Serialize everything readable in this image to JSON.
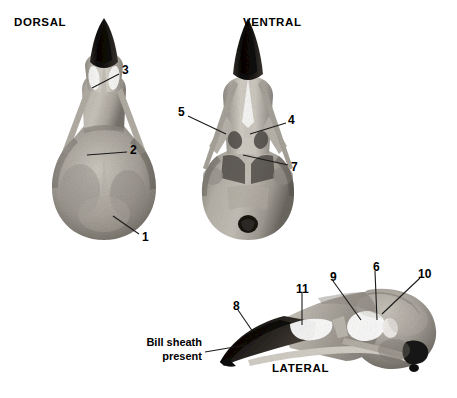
{
  "figure": {
    "background_color": "#ffffff",
    "width": 457,
    "height": 398
  },
  "views": [
    {
      "id": "dorsal",
      "title": "DORSAL",
      "x": 14,
      "y": 16
    },
    {
      "id": "ventral",
      "title": "VENTRAL",
      "x": 243,
      "y": 16
    },
    {
      "id": "lateral",
      "title": "LATERAL",
      "x": 272,
      "y": 362
    }
  ],
  "callouts": [
    {
      "id": "c3",
      "label": "3",
      "view": "dorsal",
      "x": 122,
      "y": 64,
      "line": {
        "x1": 119,
        "y1": 74,
        "x2": 92,
        "y2": 88
      }
    },
    {
      "id": "c2",
      "label": "2",
      "view": "dorsal",
      "x": 130,
      "y": 144,
      "line": {
        "x1": 127,
        "y1": 152,
        "x2": 87,
        "y2": 155
      }
    },
    {
      "id": "c1",
      "label": "1",
      "view": "dorsal",
      "x": 142,
      "y": 231,
      "line": {
        "x1": 139,
        "y1": 234,
        "x2": 113,
        "y2": 216
      }
    },
    {
      "id": "c5",
      "label": "5",
      "view": "ventral",
      "x": 178,
      "y": 106,
      "line": {
        "x1": 188,
        "y1": 116,
        "x2": 226,
        "y2": 134
      }
    },
    {
      "id": "c4",
      "label": "4",
      "view": "ventral",
      "x": 288,
      "y": 114,
      "line": {
        "x1": 286,
        "y1": 123,
        "x2": 250,
        "y2": 134
      }
    },
    {
      "id": "c7",
      "label": "7",
      "view": "ventral",
      "x": 291,
      "y": 161,
      "line": {
        "x1": 288,
        "y1": 165,
        "x2": 243,
        "y2": 155
      }
    },
    {
      "id": "c8",
      "label": "8",
      "view": "lateral",
      "x": 233,
      "y": 300,
      "line": {
        "x1": 238,
        "y1": 310,
        "x2": 253,
        "y2": 332
      }
    },
    {
      "id": "c11",
      "label": "11",
      "view": "lateral",
      "x": 296,
      "y": 283,
      "line": {
        "x1": 302,
        "y1": 293,
        "x2": 302,
        "y2": 325
      }
    },
    {
      "id": "c9",
      "label": "9",
      "view": "lateral",
      "x": 330,
      "y": 271,
      "line": {
        "x1": 333,
        "y1": 281,
        "x2": 361,
        "y2": 320
      }
    },
    {
      "id": "c6",
      "label": "6",
      "view": "lateral",
      "x": 373,
      "y": 261,
      "line": {
        "x1": 375,
        "y1": 271,
        "x2": 377,
        "y2": 320
      }
    },
    {
      "id": "c10",
      "label": "10",
      "view": "lateral",
      "x": 418,
      "y": 268,
      "line": {
        "x1": 420,
        "y1": 278,
        "x2": 382,
        "y2": 314
      }
    }
  ],
  "annotations": [
    {
      "id": "bill-sheath",
      "text": "Bill sheath\npresent",
      "x": 128,
      "y": 336,
      "width": 74,
      "line": {
        "x1": 205,
        "y1": 352,
        "x2": 252,
        "y2": 344
      }
    }
  ],
  "colors": {
    "text": "#000000",
    "leader_line": "#1a1a1a",
    "bone_light": "#d8d5ce",
    "bone_mid": "#a9a59c",
    "bone_dark": "#6e6a63",
    "bill_sheath": "#16130f",
    "shadow": "#4a4640"
  }
}
